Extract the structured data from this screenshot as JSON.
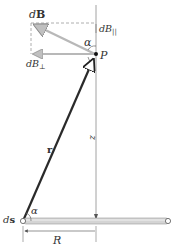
{
  "diagram": {
    "labels": {
      "dB_d": "d",
      "dB_B": "B",
      "dB_parallel_d": "dB",
      "dB_parallel_sub": "||",
      "dB_perp_d": "dB",
      "dB_perp_sub": "⊥",
      "alpha_top": "α",
      "point_P": "P",
      "vector_r": "r",
      "distance_z": "z",
      "ds_d": "d",
      "ds_s": "s",
      "alpha_bottom": "α",
      "radius_R": "R"
    },
    "colors": {
      "background": "#ffffff",
      "vector_r": "#2a2a2a",
      "vector_dB": "#b8b8b8",
      "dashed": "#9a9a9a",
      "axis": "#888888",
      "ring": "#c8c8c8",
      "text": "#333333"
    }
  }
}
